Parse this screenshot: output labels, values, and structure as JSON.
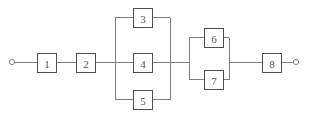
{
  "diagram": {
    "type": "reliability-block-diagram",
    "canvas": {
      "width": 311,
      "height": 125,
      "background": "#ffffff"
    },
    "colors": {
      "wire": "#808080",
      "block_border": "#4d4d4d",
      "block_fill": "#ffffff",
      "label_text": "#555555",
      "terminal_stroke": "#808080"
    },
    "terminals": [
      {
        "name": "input-terminal",
        "cx": 12,
        "cy": 62,
        "r": 2.6
      },
      {
        "name": "output-terminal",
        "cx": 296,
        "cy": 62,
        "r": 2.6
      }
    ],
    "blocks": [
      {
        "id": "block-1",
        "label": "1",
        "x": 37,
        "y": 53,
        "w": 19,
        "h": 19
      },
      {
        "id": "block-2",
        "label": "2",
        "x": 76,
        "y": 53,
        "w": 19,
        "h": 19
      },
      {
        "id": "block-3",
        "label": "3",
        "x": 133,
        "y": 8,
        "w": 19,
        "h": 19
      },
      {
        "id": "block-4",
        "label": "4",
        "x": 133,
        "y": 53,
        "w": 19,
        "h": 19
      },
      {
        "id": "block-5",
        "label": "5",
        "x": 133,
        "y": 90,
        "w": 19,
        "h": 19
      },
      {
        "id": "block-6",
        "label": "6",
        "x": 204,
        "y": 28,
        "w": 19,
        "h": 19
      },
      {
        "id": "block-7",
        "label": "7",
        "x": 204,
        "y": 70,
        "w": 19,
        "h": 19
      },
      {
        "id": "block-8",
        "label": "8",
        "x": 262,
        "y": 53,
        "w": 19,
        "h": 19
      }
    ],
    "parallel_groups": [
      {
        "name": "parallel-group-a",
        "members": [
          "3",
          "4",
          "5"
        ],
        "left_bus_x": 115,
        "right_bus_x": 170,
        "bus_top_y": 17.5,
        "bus_bottom_y": 99.5
      },
      {
        "name": "parallel-group-b",
        "members": [
          "6",
          "7"
        ],
        "left_bus_x": 189,
        "right_bus_x": 229,
        "bus_top_y": 37.5,
        "bus_bottom_y": 79.5
      }
    ],
    "wires": [
      {
        "name": "wire-input-to-block-1",
        "d": "M 14.6 62 L 37 62"
      },
      {
        "name": "wire-block-1-to-block-2",
        "d": "M 56 62 L 76 62"
      },
      {
        "name": "wire-block-2-to-bus-a",
        "d": "M 95 62 L 115 62"
      },
      {
        "name": "wire-bus-a-left",
        "d": "M 115 17.5 L 115 99.5"
      },
      {
        "name": "wire-branch-3-left",
        "d": "M 115 17.5 L 133 17.5"
      },
      {
        "name": "wire-branch-4-left",
        "d": "M 115 62.5 L 133 62.5"
      },
      {
        "name": "wire-branch-5-left",
        "d": "M 115 99.5 L 133 99.5"
      },
      {
        "name": "wire-branch-3-right",
        "d": "M 152 17.5 L 170 17.5"
      },
      {
        "name": "wire-branch-4-right",
        "d": "M 152 62.5 L 170 62.5"
      },
      {
        "name": "wire-branch-5-right",
        "d": "M 152 99.5 L 170 99.5"
      },
      {
        "name": "wire-bus-a-right",
        "d": "M 170 17.5 L 170 99.5"
      },
      {
        "name": "wire-bus-a-to-bus-b",
        "d": "M 170 62 L 189 62"
      },
      {
        "name": "wire-bus-b-left",
        "d": "M 189 37.5 L 189 79.5"
      },
      {
        "name": "wire-branch-6-left",
        "d": "M 189 37.5 L 204 37.5"
      },
      {
        "name": "wire-branch-7-left",
        "d": "M 189 79.5 L 204 79.5"
      },
      {
        "name": "wire-branch-6-right",
        "d": "M 223 37.5 L 229 37.5"
      },
      {
        "name": "wire-branch-7-right",
        "d": "M 223 79.5 L 229 79.5"
      },
      {
        "name": "wire-bus-b-right",
        "d": "M 229 37.5 L 229 79.5"
      },
      {
        "name": "wire-bus-b-to-block-8",
        "d": "M 229 62 L 262 62"
      },
      {
        "name": "wire-block-8-to-output",
        "d": "M 281 62 L 293.4 62"
      }
    ]
  }
}
